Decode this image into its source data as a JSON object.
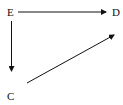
{
  "diagram": {
    "type": "directed-graph",
    "nodes": [
      {
        "id": "E",
        "label": "E"
      },
      {
        "id": "D",
        "label": "D"
      },
      {
        "id": "C",
        "label": "C"
      }
    ],
    "edges": [
      {
        "from": "E",
        "to": "D"
      },
      {
        "from": "E",
        "to": "C"
      },
      {
        "from": "C",
        "to": "D"
      }
    ],
    "colors": {
      "stroke": "#111111",
      "background": "#ffffff"
    }
  }
}
